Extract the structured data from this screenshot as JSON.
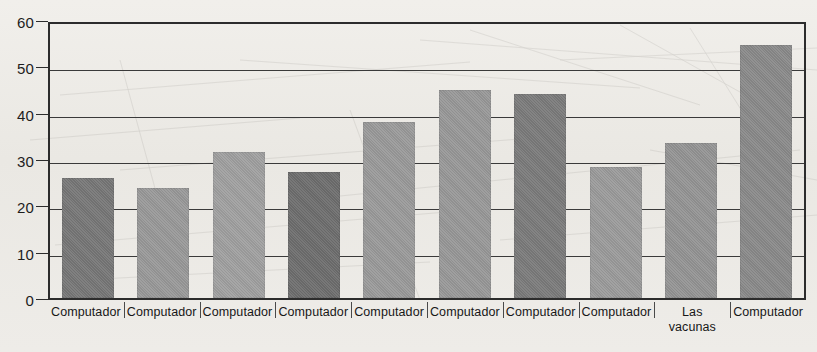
{
  "chart_data": {
    "type": "bar",
    "title": "",
    "xlabel": "",
    "ylabel": "",
    "ylim": [
      0,
      60
    ],
    "yticks": [
      0,
      10,
      20,
      30,
      40,
      50,
      60
    ],
    "grid": true,
    "legend": "none",
    "categories": [
      "Computador",
      "Computador",
      "Computador",
      "Computador",
      "Computador",
      "Computador",
      "Computador",
      "Computador",
      "Las\nvacunas",
      "Computador"
    ],
    "values": [
      26.3,
      24.2,
      32.0,
      27.6,
      38.6,
      45.5,
      44.7,
      28.7,
      33.9,
      55.5
    ],
    "bar_colors": [
      "#777777",
      "#999999",
      "#a0a0a0",
      "#6e6e6e",
      "#9a9a9a",
      "#989898",
      "#7b7b7b",
      "#9b9b9b",
      "#949494",
      "#8a8a8a"
    ]
  },
  "axes": {
    "y_tick_labels": [
      "0",
      "10",
      "20",
      "30",
      "40",
      "50",
      "60"
    ]
  },
  "colors": {
    "background": "#edebe7",
    "axis": "#2c2c2c",
    "gridline": "#3a3a3a",
    "text": "#1d1d1d"
  }
}
